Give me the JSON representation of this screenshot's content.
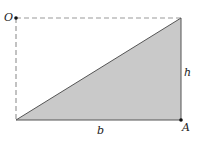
{
  "diagram": {
    "type": "right-triangle-in-rectangle",
    "colors": {
      "fill": "#c9c9c9",
      "stroke": "#555555",
      "dashed": "#9a9a9a",
      "point": "#111111"
    },
    "points": {
      "O": {
        "label": "O",
        "x": 16,
        "y": 18
      },
      "A": {
        "label": "A",
        "x": 181,
        "y": 120
      },
      "top_right": {
        "x": 181,
        "y": 18
      },
      "bottom_left": {
        "x": 16,
        "y": 120
      }
    },
    "labels": {
      "O": "O",
      "A": "A",
      "h": "h",
      "b": "b"
    }
  }
}
